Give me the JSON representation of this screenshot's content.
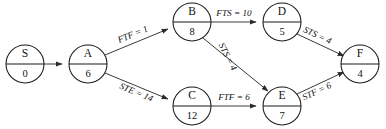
{
  "diagram": {
    "type": "activity-on-node-network",
    "title": "",
    "canvas": {
      "width": 386,
      "height": 129,
      "background": "#ffffff"
    },
    "style": {
      "node_stroke": "#1a1a1a",
      "node_fill": "#ffffff",
      "edge_stroke": "#3a3a3a",
      "text_color": "#111111",
      "node_radius": 19
    },
    "nodes": [
      {
        "id": "S",
        "label": "S",
        "duration": "0",
        "cx": 25,
        "cy": 64
      },
      {
        "id": "A",
        "label": "A",
        "duration": "6",
        "cx": 88,
        "cy": 64
      },
      {
        "id": "B",
        "label": "B",
        "duration": "8",
        "cx": 192,
        "cy": 22
      },
      {
        "id": "C",
        "label": "C",
        "duration": "12",
        "cx": 192,
        "cy": 106
      },
      {
        "id": "D",
        "label": "D",
        "duration": "5",
        "cx": 282,
        "cy": 22
      },
      {
        "id": "E",
        "label": "E",
        "duration": "7",
        "cx": 282,
        "cy": 106
      },
      {
        "id": "F",
        "label": "F",
        "duration": "4",
        "cx": 360,
        "cy": 64
      }
    ],
    "edges": [
      {
        "id": "S-A",
        "from": "S",
        "to": "A",
        "label": "",
        "relation": "",
        "lag": ""
      },
      {
        "id": "A-B",
        "from": "A",
        "to": "B",
        "label": "FTF = 1",
        "relation": "FTF",
        "lag": "1"
      },
      {
        "id": "A-C",
        "from": "A",
        "to": "C",
        "label": "STE = 14",
        "relation": "STE",
        "lag": "14"
      },
      {
        "id": "B-D",
        "from": "B",
        "to": "D",
        "label": "FTS = 10",
        "relation": "FTS",
        "lag": "10"
      },
      {
        "id": "B-E",
        "from": "B",
        "to": "E",
        "label": "STS = 4",
        "relation": "STS",
        "lag": "4"
      },
      {
        "id": "C-E",
        "from": "C",
        "to": "E",
        "label": "FTF = 6",
        "relation": "FTF",
        "lag": "6"
      },
      {
        "id": "D-F",
        "from": "D",
        "to": "F",
        "label": "STS = 4",
        "relation": "STS",
        "lag": "4"
      },
      {
        "id": "E-F",
        "from": "E",
        "to": "F",
        "label": "STF = 6",
        "relation": "STF",
        "lag": "6"
      }
    ]
  }
}
